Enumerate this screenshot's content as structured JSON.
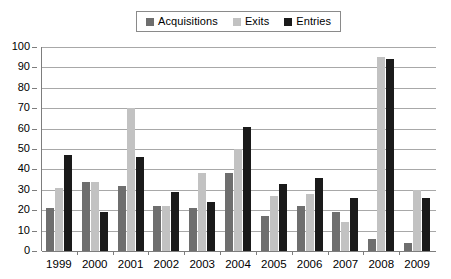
{
  "chart_data": {
    "type": "bar",
    "title": "",
    "subtitle": "",
    "xlabel": "",
    "ylabel": "",
    "categories": [
      "1999",
      "2000",
      "2001",
      "2002",
      "2003",
      "2004",
      "2005",
      "2006",
      "2007",
      "2008",
      "2009"
    ],
    "series": [
      {
        "name": "Acquisitions",
        "color": "#6e6e6e",
        "values": [
          21,
          34,
          32,
          22,
          21,
          38,
          17,
          22,
          19,
          6,
          4
        ]
      },
      {
        "name": "Exits",
        "color": "#c2c2c2",
        "values": [
          31,
          34,
          70,
          22,
          38,
          50,
          27,
          28,
          14,
          95,
          30
        ]
      },
      {
        "name": "Entries",
        "color": "#1a1a1a",
        "values": [
          47,
          19,
          46,
          29,
          24,
          61,
          33,
          36,
          26,
          94,
          26
        ]
      }
    ],
    "ylim": [
      0,
      100
    ],
    "y_ticks": [
      "0",
      "10",
      "20",
      "30",
      "40",
      "50",
      "60",
      "70",
      "80",
      "90",
      "100"
    ],
    "grid": true,
    "grid_axis": "y",
    "legend_position": "top-center",
    "legend_entries": [
      "Acquisitions",
      "Exits",
      "Entries"
    ]
  },
  "axes": {
    "axis_color": "#7d7d7d",
    "grid_color": "#a8a8a8"
  }
}
